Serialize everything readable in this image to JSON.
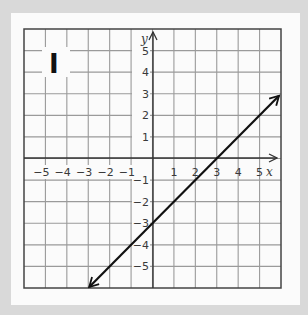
{
  "graph": {
    "label": "I",
    "x_axis_label": "x",
    "y_axis_label": "y",
    "x_tick_labels": [
      "−5",
      "−4",
      "−3",
      "−2",
      "−1",
      "1",
      "2",
      "3",
      "4",
      "5"
    ],
    "y_tick_labels": [
      "5",
      "4",
      "3",
      "2",
      "1",
      "−1",
      "−2",
      "−3",
      "−4",
      "−5"
    ]
  },
  "colors": {
    "background": "#d9d9d9",
    "panel": "#fbfbfb",
    "grid": "#9a9a9a",
    "axis": "#333333",
    "line": "#111111"
  },
  "chart_data": {
    "type": "line",
    "title": "I",
    "xlabel": "x",
    "ylabel": "y",
    "xlim": [
      -6,
      6
    ],
    "ylim": [
      -6,
      6
    ],
    "grid": true,
    "x_ticks": [
      -5,
      -4,
      -3,
      -2,
      -1,
      1,
      2,
      3,
      4,
      5
    ],
    "y_ticks": [
      -5,
      -4,
      -3,
      -2,
      -1,
      1,
      2,
      3,
      4,
      5
    ],
    "series": [
      {
        "name": "y = x - 3",
        "equation": "y = x - 3",
        "slope": 1,
        "y_intercept": -3,
        "x_intercept": 3,
        "points": [
          [
            -3,
            -6
          ],
          [
            0,
            -3
          ],
          [
            3,
            0
          ],
          [
            6,
            3
          ]
        ],
        "arrows_both_ends": true
      }
    ]
  }
}
